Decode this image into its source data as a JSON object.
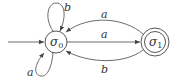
{
  "diagram": {
    "type": "finite-state-automaton",
    "colors": {
      "stroke": "#444444",
      "text": "#333333",
      "background": "#ffffff"
    },
    "states": [
      {
        "id": "s0",
        "label": "σ",
        "subscript": "0",
        "initial": true,
        "accepting": false
      },
      {
        "id": "s1",
        "label": "σ",
        "subscript": "1",
        "initial": false,
        "accepting": true
      }
    ],
    "transitions": [
      {
        "from": "s0",
        "to": "s0",
        "label": "b",
        "position": "top-loop"
      },
      {
        "from": "s0",
        "to": "s0",
        "label": "a",
        "position": "bottom-loop"
      },
      {
        "from": "s1",
        "to": "s0",
        "label": "a",
        "position": "upper-arc"
      },
      {
        "from": "s0",
        "to": "s1",
        "label": "a",
        "position": "straight"
      },
      {
        "from": "s1",
        "to": "s0",
        "label": "b",
        "position": "lower-arc"
      }
    ]
  }
}
